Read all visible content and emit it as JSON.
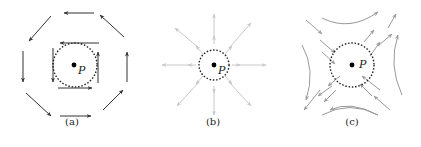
{
  "figure": {
    "panels": [
      {
        "id": "a",
        "caption": "(a)",
        "point_label": "P",
        "type": "rotation",
        "arrow_color": "#333333"
      },
      {
        "id": "b",
        "caption": "(b)",
        "point_label": "P",
        "type": "source",
        "arrow_color": "#c8c8c8"
      },
      {
        "id": "c",
        "caption": "(c)",
        "point_label": "P",
        "type": "saddle",
        "arrow_color": "#9a9a9a"
      }
    ],
    "circle_style": "dotted",
    "point_color": "#000000"
  }
}
